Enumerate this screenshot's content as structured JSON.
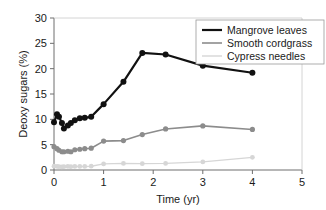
{
  "chart_data": {
    "type": "line",
    "title": "",
    "xlabel": "Time (yr)",
    "ylabel": "Deoxy sugars (%)",
    "xlim": [
      0,
      5
    ],
    "ylim": [
      0,
      30
    ],
    "xticks": [
      0,
      1,
      2,
      3,
      4,
      5
    ],
    "xtick_labels": [
      "0",
      "1",
      "2",
      "3",
      "4",
      "5"
    ],
    "yticks": [
      0,
      5,
      10,
      15,
      20,
      25,
      30
    ],
    "ytick_labels": [
      "0",
      "5",
      "10",
      "15",
      "20",
      "25",
      "30"
    ],
    "grid": false,
    "legend_position": "top-right",
    "series": [
      {
        "name": "Mangrove leaves",
        "color": "#111111",
        "line_width": 2.2,
        "marker": "circle",
        "marker_size": 3.0,
        "x": [
          0.0,
          0.06,
          0.1,
          0.16,
          0.2,
          0.28,
          0.34,
          0.42,
          0.52,
          0.62,
          0.75,
          1.0,
          1.4,
          1.78,
          2.25,
          3.0,
          4.0
        ],
        "y": [
          9.4,
          11.0,
          10.5,
          9.3,
          8.2,
          8.8,
          9.3,
          9.8,
          10.2,
          10.3,
          10.5,
          13.0,
          17.4,
          23.1,
          22.8,
          20.6,
          19.2
        ]
      },
      {
        "name": "Smooth cordgrass",
        "color": "#8c8c8c",
        "line_width": 1.6,
        "marker": "circle",
        "marker_size": 2.6,
        "x": [
          0.0,
          0.06,
          0.1,
          0.16,
          0.2,
          0.28,
          0.34,
          0.42,
          0.52,
          0.62,
          0.75,
          1.0,
          1.4,
          1.78,
          2.25,
          3.0,
          4.0
        ],
        "y": [
          4.6,
          4.2,
          3.9,
          3.6,
          3.6,
          3.7,
          3.6,
          4.0,
          4.1,
          4.2,
          4.3,
          5.7,
          5.8,
          7.0,
          8.1,
          8.7,
          8.0
        ]
      },
      {
        "name": "Cypress needles",
        "color": "#d6d6d6",
        "line_width": 1.4,
        "marker": "circle",
        "marker_size": 2.4,
        "x": [
          0.0,
          0.06,
          0.1,
          0.16,
          0.2,
          0.28,
          0.34,
          0.42,
          0.52,
          0.62,
          0.75,
          1.0,
          1.4,
          1.78,
          2.25,
          3.0,
          4.0
        ],
        "y": [
          0.75,
          0.7,
          0.65,
          0.6,
          0.65,
          0.7,
          0.65,
          0.7,
          0.7,
          0.7,
          0.75,
          1.2,
          1.3,
          1.25,
          1.3,
          1.6,
          2.5
        ]
      }
    ]
  },
  "legend": {
    "entries": [
      {
        "label": "Mangrove leaves"
      },
      {
        "label": "Smooth cordgrass"
      },
      {
        "label": "Cypress needles"
      }
    ]
  },
  "axes": {
    "x_title": "Time (yr)",
    "y_title": "Deoxy sugars (%)"
  }
}
